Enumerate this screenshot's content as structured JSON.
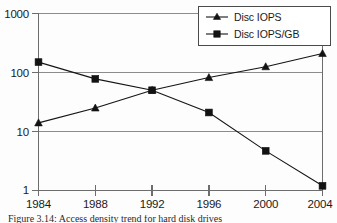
{
  "chart_data": {
    "type": "line",
    "title": "",
    "xlabel": "",
    "ylabel": "",
    "categories": [
      "1984",
      "1988",
      "1992",
      "1996",
      "2000",
      "2004"
    ],
    "x": [
      1984,
      1988,
      1992,
      1996,
      2000,
      2004
    ],
    "yscale": "log",
    "ylim": [
      1,
      1000
    ],
    "yticks": [
      1,
      10,
      100,
      1000
    ],
    "ytick_labels": [
      "1",
      "10",
      "100",
      "1000"
    ],
    "xtick_labels": [
      "1984",
      "1988",
      "1992",
      "1996",
      "2000",
      "2004"
    ],
    "grid": true,
    "grid_axis": "y",
    "legend_position": "top-right",
    "series": [
      {
        "name": "Disc IOPS",
        "marker": "triangle",
        "values": [
          14,
          25,
          50,
          82,
          125,
          210
        ]
      },
      {
        "name": "Disc IOPS/GB",
        "marker": "square",
        "values": [
          150,
          78,
          50,
          21,
          4.7,
          1.2
        ]
      }
    ]
  },
  "legend": {
    "entries": [
      {
        "label": "Disc IOPS",
        "marker": "triangle-marker"
      },
      {
        "label": "Disc IOPS/GB",
        "marker": "square-marker"
      }
    ]
  },
  "axes": {
    "y_labels": [
      "1000",
      "100",
      "10",
      "1"
    ],
    "x_labels": [
      "1984",
      "1988",
      "1992",
      "1996",
      "2000",
      "2004"
    ]
  },
  "caption": {
    "text": "Figure 3.14: Access density trend for hard disk drives"
  }
}
